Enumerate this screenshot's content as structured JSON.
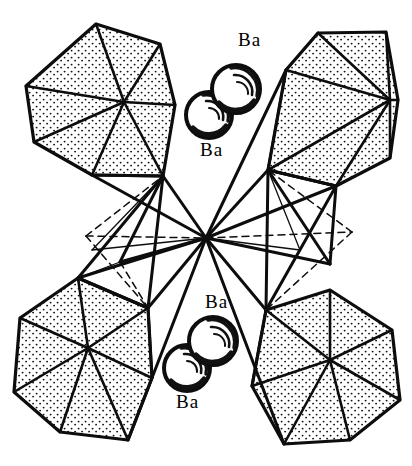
{
  "figure": {
    "type": "crystal-structure-polyhedral-diagram",
    "background_color": "#ffffff",
    "ink_color": "#000000",
    "line_style": {
      "solid_edge_color": "#0d0d0d",
      "hidden_edge_style": "dashed",
      "face_fill": "stipple"
    }
  },
  "labels": [
    {
      "id": "ba-top-upper",
      "text": "Ba",
      "x": 238,
      "y": 30
    },
    {
      "id": "ba-top-lower",
      "text": "Ba",
      "x": 200,
      "y": 140
    },
    {
      "id": "ba-bottom-upper",
      "text": "Ba",
      "x": 205,
      "y": 292
    },
    {
      "id": "ba-bottom-lower",
      "text": "Ba",
      "x": 176,
      "y": 392
    }
  ],
  "atoms": [
    {
      "id": "ba-sphere-1",
      "element": "Ba",
      "cx": 236,
      "cy": 89,
      "r": 24,
      "label": "ba-top-upper"
    },
    {
      "id": "ba-sphere-2",
      "element": "Ba",
      "cx": 209,
      "cy": 115,
      "r": 23,
      "label": "ba-top-lower"
    },
    {
      "id": "ba-sphere-3",
      "element": "Ba",
      "cx": 213,
      "cy": 341,
      "r": 24,
      "label": "ba-bottom-upper"
    },
    {
      "id": "ba-sphere-4",
      "element": "Ba",
      "cx": 187,
      "cy": 368,
      "r": 23,
      "label": "ba-bottom-lower"
    }
  ],
  "polyhedra": [
    {
      "id": "polyhedron-top-left",
      "shading": "stippled",
      "position": "top-left"
    },
    {
      "id": "polyhedron-top-right",
      "shading": "stippled",
      "position": "top-right"
    },
    {
      "id": "polyhedron-bottom-left",
      "shading": "stippled",
      "position": "bottom-left"
    },
    {
      "id": "polyhedron-bottom-right",
      "shading": "stippled",
      "position": "bottom-right"
    },
    {
      "id": "polyhedron-center-left",
      "shading": "open-wireframe",
      "position": "center-left"
    },
    {
      "id": "polyhedron-center-right",
      "shading": "open-wireframe",
      "position": "center-right"
    }
  ],
  "central_vertex": {
    "id": "shared-apex",
    "x": 206,
    "y": 238
  }
}
